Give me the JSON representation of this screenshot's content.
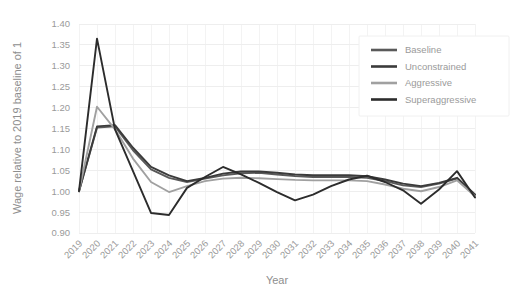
{
  "chart_data": {
    "type": "line",
    "title": "",
    "xlabel": "Year",
    "ylabel": "Wage relative to 2019 baseline of 1",
    "x": [
      2019,
      2020,
      2021,
      2022,
      2023,
      2024,
      2025,
      2026,
      2027,
      2028,
      2029,
      2030,
      2031,
      2032,
      2033,
      2034,
      2035,
      2036,
      2037,
      2038,
      2039,
      2040,
      2041
    ],
    "xtick_labels": [
      "2019",
      "2020",
      "2021",
      "2022",
      "2023",
      "2024",
      "2025",
      "2026",
      "2027",
      "2028",
      "2029",
      "2030",
      "2031",
      "2032",
      "2033",
      "2034",
      "2035",
      "2036",
      "2037",
      "2038",
      "2039",
      "2040",
      "2041"
    ],
    "ytick_labels": [
      "0.90",
      "0.95",
      "1.00",
      "1.05",
      "1.10",
      "1.15",
      "1.20",
      "1.25",
      "1.30",
      "1.35",
      "1.40"
    ],
    "ytick_values": [
      0.9,
      0.95,
      1.0,
      1.05,
      1.1,
      1.15,
      1.2,
      1.25,
      1.3,
      1.35,
      1.4
    ],
    "ylim": [
      0.9,
      1.4
    ],
    "xlim": [
      2019,
      2041
    ],
    "grid": "horizontal",
    "legend_position": "top-right",
    "series": [
      {
        "name": "Baseline",
        "color": "#5a5a5a",
        "values": [
          1.0,
          1.152,
          1.155,
          1.098,
          1.052,
          1.032,
          1.022,
          1.03,
          1.038,
          1.043,
          1.044,
          1.04,
          1.036,
          1.034,
          1.034,
          1.034,
          1.032,
          1.024,
          1.014,
          1.01,
          1.018,
          1.03,
          0.99
        ]
      },
      {
        "name": "Unconstrained",
        "color": "#3b3b3b",
        "values": [
          1.0,
          1.155,
          1.158,
          1.104,
          1.058,
          1.038,
          1.024,
          1.032,
          1.042,
          1.047,
          1.047,
          1.044,
          1.04,
          1.038,
          1.038,
          1.038,
          1.036,
          1.028,
          1.018,
          1.012,
          1.02,
          1.032,
          0.992
        ]
      },
      {
        "name": "Aggressive",
        "color": "#a0a0a0",
        "values": [
          1.0,
          1.202,
          1.148,
          1.078,
          1.022,
          0.998,
          1.012,
          1.024,
          1.03,
          1.032,
          1.031,
          1.029,
          1.027,
          1.026,
          1.026,
          1.026,
          1.024,
          1.016,
          1.006,
          1.0,
          1.01,
          1.026,
          0.988
        ]
      },
      {
        "name": "Superaggressive",
        "color": "#2c2c2c",
        "values": [
          1.0,
          1.365,
          1.148,
          1.048,
          0.948,
          0.943,
          1.008,
          1.034,
          1.058,
          1.04,
          1.02,
          0.998,
          0.978,
          0.992,
          1.012,
          1.028,
          1.037,
          1.022,
          1.002,
          0.97,
          1.004,
          1.048,
          0.985
        ]
      }
    ]
  }
}
